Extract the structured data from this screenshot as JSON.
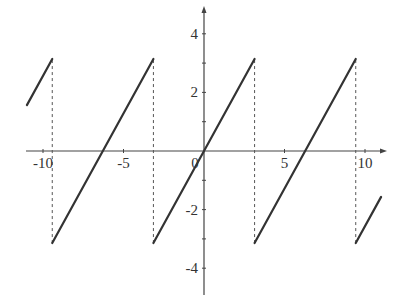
{
  "chart_data": {
    "type": "line",
    "title": "",
    "xlabel": "",
    "ylabel": "",
    "xlim": [
      -11.1,
      11.1
    ],
    "ylim": [
      -4.9,
      4.9
    ],
    "grid": false,
    "legend": null,
    "x_ticks": [
      -10,
      -5,
      0,
      5,
      10
    ],
    "x_tick_labels": [
      "-10",
      "-5",
      "0",
      "5",
      "10"
    ],
    "x_minor_ticks": [
      -10,
      -5,
      5,
      10
    ],
    "y_ticks": [
      -4,
      -2,
      2,
      4
    ],
    "y_tick_labels": [
      "-4",
      "-2",
      "2",
      "4"
    ],
    "y_minor_ticks": [
      -4,
      -3,
      -2,
      -1,
      1,
      2,
      3,
      4
    ],
    "series": [
      {
        "name": "sawtooth",
        "style": "solid",
        "color": "#333333",
        "segments": [
          {
            "x": [
              -11.0,
              -9.4248
            ],
            "y": [
              1.5664,
              3.1416
            ]
          },
          {
            "x": [
              -9.4248,
              -3.1416
            ],
            "y": [
              -3.1416,
              3.1416
            ]
          },
          {
            "x": [
              -3.1416,
              3.1416
            ],
            "y": [
              -3.1416,
              3.1416
            ]
          },
          {
            "x": [
              3.1416,
              9.4248
            ],
            "y": [
              -3.1416,
              3.1416
            ]
          },
          {
            "x": [
              9.4248,
              11.0
            ],
            "y": [
              -3.1416,
              -1.5664
            ]
          }
        ]
      },
      {
        "name": "discontinuity-guides",
        "style": "dashed",
        "color": "#555555",
        "lines": [
          {
            "x": -9.4248,
            "y": [
              -3.1416,
              3.1416
            ]
          },
          {
            "x": -3.1416,
            "y": [
              -3.1416,
              3.1416
            ]
          },
          {
            "x": 3.1416,
            "y": [
              -3.1416,
              3.1416
            ]
          },
          {
            "x": 9.4248,
            "y": [
              -3.1416,
              3.1416
            ]
          }
        ]
      }
    ]
  },
  "layout": {
    "origin_px": [
      204,
      151
    ],
    "px_per_unit_x": 16.1,
    "px_per_unit_y": 29.3,
    "x_axis_px": [
      26,
      383
    ],
    "y_axis_px": [
      10,
      295
    ]
  },
  "colors": {
    "axis": "#444444",
    "curve": "#333333",
    "dashed": "#555555",
    "background": "#ffffff"
  }
}
